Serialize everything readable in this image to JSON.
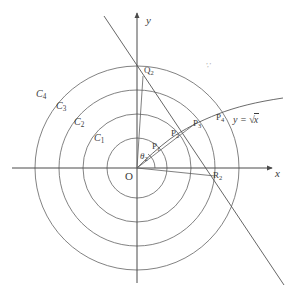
{
  "figure": {
    "axes": {
      "x_label": "x",
      "y_label": "y",
      "origin_label": "O"
    },
    "curve": {
      "equation_label": "y = √x",
      "equation_lhs": "y",
      "equation_eq": "=",
      "equation_radical": "√",
      "equation_radicand": "x"
    },
    "circles": [
      {
        "name": "C1",
        "label_base": "C",
        "label_sub": "1",
        "radius_px": 30
      },
      {
        "name": "C2",
        "label_base": "C",
        "label_sub": "2",
        "radius_px": 54
      },
      {
        "name": "C3",
        "label_base": "C",
        "label_sub": "3",
        "radius_px": 78
      },
      {
        "name": "C4",
        "label_base": "C",
        "label_sub": "4",
        "radius_px": 102
      }
    ],
    "points": [
      {
        "name": "P1",
        "label_base": "P",
        "label_sub": "1"
      },
      {
        "name": "P2",
        "label_base": "P",
        "label_sub": "2"
      },
      {
        "name": "P3",
        "label_base": "P",
        "label_sub": "3"
      },
      {
        "name": "P4",
        "label_base": "P",
        "label_sub": "4"
      },
      {
        "name": "Q2",
        "label_base": "Q",
        "label_sub": "2"
      },
      {
        "name": "R2",
        "label_base": "R",
        "label_sub": "2"
      }
    ],
    "angle": {
      "label_base": "θ",
      "label_sub": "2"
    },
    "faint_mark": "∵",
    "colors": {
      "stroke": "#5a5a5a",
      "axis": "#4a4a4a",
      "text": "#3b3b3b",
      "background": "#ffffff"
    }
  }
}
